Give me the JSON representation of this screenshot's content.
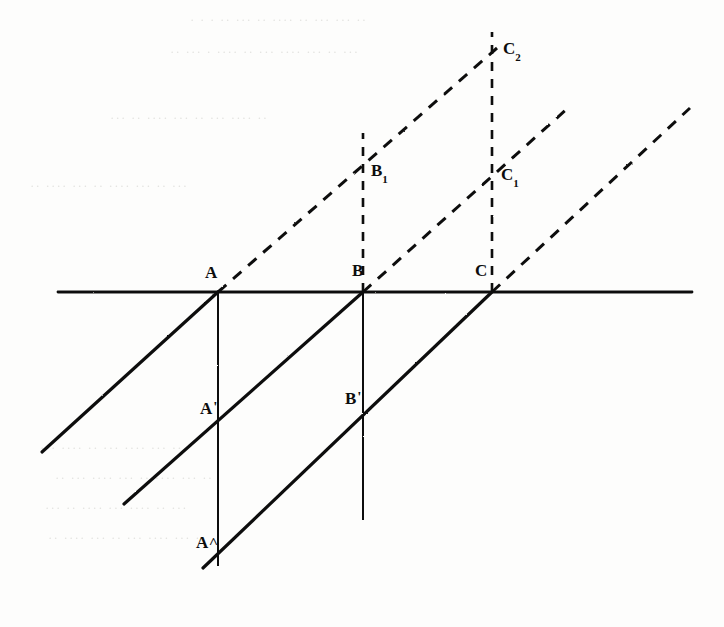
{
  "figure": {
    "ink_color": "#111111",
    "paper_color": "#fdfdfc",
    "width": 724,
    "height": 627,
    "baseline_y": 292,
    "baseline_x_start": 58,
    "baseline_x_end": 692
  },
  "labels": {
    "A": "A",
    "B": "B",
    "C": "C",
    "A_prime": "A",
    "A_prime_mark": "'",
    "B_prime": "B",
    "B_prime_mark": "'",
    "A_double_prime": "A",
    "A_double_prime_mark": "˄",
    "B_one": "B",
    "B_one_sub": "1",
    "C_one": "C",
    "C_one_sub": "1",
    "C_two": "C",
    "C_two_sub": "2"
  },
  "points": [
    {
      "name": "A",
      "label": "A",
      "x": 218,
      "y": 292,
      "on": "baseline"
    },
    {
      "name": "B",
      "label": "B",
      "x": 363,
      "y": 292,
      "on": "baseline"
    },
    {
      "name": "C",
      "label": "C",
      "x": 492,
      "y": 292,
      "on": "baseline"
    },
    {
      "name": "A1",
      "label": "A'",
      "x": 218,
      "y": 424,
      "on": "vertical-A"
    },
    {
      "name": "B1",
      "label": "B'",
      "x": 363,
      "y": 412,
      "on": "vertical-B"
    },
    {
      "name": "A2",
      "label": "A''",
      "x": 218,
      "y": 556,
      "on": "vertical-A"
    },
    {
      "name": "Bu",
      "label": "B1",
      "x": 363,
      "y": 172,
      "on": "vertical-B-dashed"
    },
    {
      "name": "Cu",
      "label": "C1",
      "x": 492,
      "y": 178,
      "on": "vertical-C-dashed"
    },
    {
      "name": "Cv",
      "label": "C2",
      "x": 492,
      "y": 52,
      "on": "vertical-C-dashed"
    }
  ],
  "label_positions": [
    {
      "id": "A",
      "x": 205,
      "y": 264
    },
    {
      "id": "B",
      "x": 352,
      "y": 262
    },
    {
      "id": "C",
      "x": 475,
      "y": 262
    },
    {
      "id": "Ap",
      "x": 200,
      "y": 400
    },
    {
      "id": "Bp",
      "x": 345,
      "y": 390
    },
    {
      "id": "App",
      "x": 196,
      "y": 534
    },
    {
      "id": "B1",
      "x": 371,
      "y": 162
    },
    {
      "id": "C1",
      "x": 501,
      "y": 166
    },
    {
      "id": "C2",
      "x": 503,
      "y": 40
    }
  ],
  "solid_lines": [
    {
      "name": "baseline",
      "x1": 58,
      "y1": 292,
      "x2": 692,
      "y2": 292,
      "width": 2.6
    },
    {
      "name": "transversal-A",
      "x1": 218,
      "y1": 292,
      "x2": 42,
      "y2": 452,
      "width": 3.0
    },
    {
      "name": "transversal-B",
      "x1": 363,
      "y1": 292,
      "x2": 124,
      "y2": 504,
      "width": 3.0
    },
    {
      "name": "transversal-C",
      "x1": 492,
      "y1": 292,
      "x2": 203,
      "y2": 568,
      "width": 3.0
    },
    {
      "name": "vertical-A",
      "x1": 218,
      "y1": 292,
      "x2": 218,
      "y2": 566,
      "width": 1.8
    },
    {
      "name": "vertical-B",
      "x1": 363,
      "y1": 292,
      "x2": 363,
      "y2": 520,
      "width": 1.8
    }
  ],
  "dashed_lines": [
    {
      "name": "ray-from-A",
      "x1": 218,
      "y1": 292,
      "x2": 497,
      "y2": 48
    },
    {
      "name": "ray-from-B",
      "x1": 363,
      "y1": 292,
      "x2": 568,
      "y2": 108
    },
    {
      "name": "ray-from-C",
      "x1": 492,
      "y1": 292,
      "x2": 690,
      "y2": 108
    },
    {
      "name": "vertical-B-dashed",
      "x1": 363,
      "y1": 292,
      "x2": 363,
      "y2": 133
    },
    {
      "name": "vertical-C-dashed",
      "x1": 492,
      "y1": 292,
      "x2": 492,
      "y2": 32
    }
  ],
  "ghost_text_rows": [
    {
      "text": "· · ·   ·· ··· ·· ···· ·· ··· ··· ··",
      "x": 190,
      "y": 12
    },
    {
      "text": "·· ··· · ···· ·· ··· ···· ··· ·· ···",
      "x": 170,
      "y": 44
    },
    {
      "text": "··· ·· ···· ··· ·· ··· ···· ··",
      "x": 110,
      "y": 110
    },
    {
      "text": "·· ···· ··· ·· ···· ··· ·· ···",
      "x": 30,
      "y": 178
    },
    {
      "text": "··· ···· ·· ··· ···· ··· ··",
      "x": 40,
      "y": 440
    },
    {
      "text": "·· ··· ···· ··· ·· ···· ··· ··",
      "x": 55,
      "y": 470
    },
    {
      "text": "··· ·· ···· ··· ···· ·· ···",
      "x": 45,
      "y": 500
    },
    {
      "text": "·· ···· ··· ·· ··· ···· ··· ··",
      "x": 48,
      "y": 530
    }
  ]
}
